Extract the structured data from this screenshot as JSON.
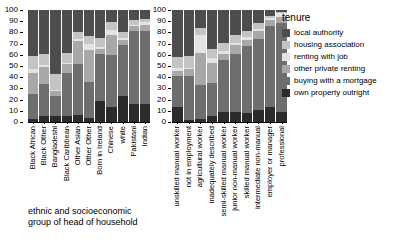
{
  "chart_data": [
    {
      "id": "ethnic",
      "type": "bar",
      "stacked": true,
      "title": "",
      "xlabel": "ethnic and socioeconomic\ngroup of head of household",
      "ylabel": "",
      "ylim": [
        0,
        100
      ],
      "yticks": [
        0,
        10,
        20,
        30,
        40,
        50,
        60,
        70,
        80,
        90,
        100
      ],
      "grid": false,
      "categories": [
        "Black African",
        "Black Other",
        "Bangladeshi",
        "Black Caribbean",
        "Other Asian",
        "Other Other",
        "Born in Ireland",
        "Chinese",
        "white",
        "Pakistani",
        "Indian"
      ],
      "series": [
        {
          "name": "own property outright",
          "values": [
            3,
            5,
            5,
            5,
            6,
            4,
            19,
            13,
            23,
            16,
            16
          ]
        },
        {
          "name": "buying with a mortgage",
          "values": [
            22,
            29,
            18,
            39,
            46,
            32,
            42,
            47,
            46,
            65,
            65
          ]
        },
        {
          "name": "other private renting",
          "values": [
            19,
            15,
            5,
            8,
            20,
            28,
            4,
            18,
            4,
            5,
            6
          ]
        },
        {
          "name": "renting with job",
          "values": [
            3,
            2,
            1,
            1,
            2,
            6,
            2,
            4,
            2,
            1,
            2
          ]
        },
        {
          "name": "housing association",
          "values": [
            12,
            10,
            14,
            9,
            6,
            7,
            8,
            7,
            5,
            4,
            3
          ]
        },
        {
          "name": "local authority",
          "values": [
            41,
            39,
            57,
            38,
            20,
            23,
            25,
            11,
            20,
            9,
            8
          ]
        }
      ]
    },
    {
      "id": "socioeconomic",
      "type": "bar",
      "stacked": true,
      "title": "",
      "xlabel": "",
      "ylabel": "",
      "ylim": [
        0,
        100
      ],
      "yticks": [
        0,
        10,
        20,
        30,
        40,
        50,
        60,
        70,
        80,
        90,
        100
      ],
      "grid": false,
      "categories": [
        "unskilled manual worker",
        "not in employment",
        "agricultural worker",
        "inadequately described",
        "semi-skilled manual worker",
        "junior non-manual worker",
        "skilled manual worker",
        "intermediate non-manual",
        "employer or manager",
        "professional"
      ],
      "series": [
        {
          "name": "own property outright",
          "values": [
            13,
            2,
            3,
            5,
            9,
            9,
            8,
            11,
            13,
            9
          ]
        },
        {
          "name": "buying with a mortgage",
          "values": [
            28,
            39,
            30,
            30,
            46,
            52,
            60,
            63,
            73,
            79
          ]
        },
        {
          "name": "other private renting",
          "values": [
            5,
            6,
            29,
            18,
            6,
            8,
            5,
            7,
            5,
            6
          ]
        },
        {
          "name": "renting with job",
          "values": [
            2,
            1,
            16,
            4,
            2,
            2,
            3,
            2,
            2,
            3
          ]
        },
        {
          "name": "housing association",
          "values": [
            10,
            11,
            6,
            8,
            8,
            7,
            5,
            5,
            2,
            1
          ]
        },
        {
          "name": "local authority",
          "values": [
            42,
            41,
            16,
            35,
            29,
            22,
            19,
            12,
            5,
            2
          ]
        }
      ]
    }
  ],
  "legend": {
    "title": "tenure",
    "position": "right",
    "items": [
      {
        "label": "local authority",
        "color": "#4d4d4d"
      },
      {
        "label": "housing association",
        "color": "#c4c4c4"
      },
      {
        "label": "renting with job",
        "color": "#e3e3e3"
      },
      {
        "label": "other private renting",
        "color": "#a8a8a8"
      },
      {
        "label": "buying with a mortgage",
        "color": "#6e6e6e"
      },
      {
        "label": "own property outright",
        "color": "#2b2b2b"
      }
    ]
  },
  "colors": {
    "local_authority": "#4d4d4d",
    "housing_association": "#c4c4c4",
    "renting_with_job": "#e3e3e3",
    "other_private_renting": "#a8a8a8",
    "buying_with_a_mortgage": "#6e6e6e",
    "own_property_outright": "#2b2b2b",
    "background": "#ffffff",
    "axis": "#000000"
  },
  "captions": {
    "left": "ethnic and socioeconomic\ngroup of head of household"
  }
}
